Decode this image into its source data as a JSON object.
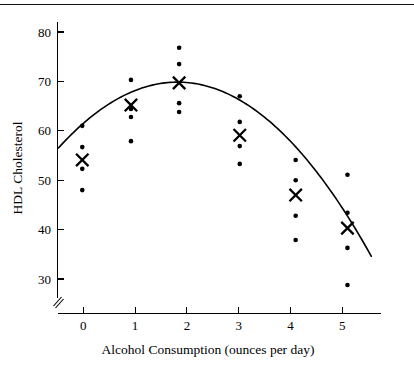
{
  "chart_data": {
    "type": "scatter",
    "title": "",
    "xlabel": "Alcohol Consumption (ounces per day)",
    "ylabel": "HDL Cholesterol",
    "xlim": [
      -0.62,
      5.75
    ],
    "ylim": [
      26.5,
      82.5
    ],
    "xticks": [
      0,
      1,
      2,
      3,
      4,
      5
    ],
    "xtick_labels": [
      "0",
      "1",
      "2",
      "3",
      "4",
      "5"
    ],
    "yticks": [
      30,
      40,
      50,
      60,
      70,
      80
    ],
    "ytick_labels": [
      "30",
      "40",
      "50",
      "60",
      "70",
      "80"
    ],
    "grid": false,
    "legend": "none",
    "axis_break": true,
    "point_color": "#000000",
    "curve_color": "#000000",
    "groups": [
      {
        "x": 0.0,
        "mean_x": -0.02,
        "mean_y": 54.1,
        "values": [
          61.0,
          56.7,
          52.3,
          48.0
        ]
      },
      {
        "x": 1.0,
        "mean_x": 0.92,
        "mean_y": 65.2,
        "values": [
          70.3,
          64.4,
          62.8,
          57.9
        ]
      },
      {
        "x": 2.0,
        "mean_x": 1.85,
        "mean_y": 69.7,
        "values": [
          76.8,
          73.5,
          65.6,
          63.8
        ]
      },
      {
        "x": 3.0,
        "mean_x": 3.02,
        "mean_y": 59.1,
        "values": [
          67.0,
          61.8,
          56.9,
          53.3
        ]
      },
      {
        "x": 4.0,
        "mean_x": 4.1,
        "mean_y": 47.0,
        "values": [
          54.1,
          50.0,
          42.8,
          37.9
        ]
      },
      {
        "x": 5.0,
        "mean_x": 5.1,
        "mean_y": 40.3,
        "values": [
          51.1,
          43.4,
          36.3,
          28.8
        ]
      }
    ],
    "fit_curve": {
      "kind": "quadratic",
      "x_start": -0.48,
      "x_end": 5.56,
      "vertex_x": 1.82,
      "vertex_y": 69.85,
      "a": -2.52
    }
  },
  "figure": {
    "top_rule": true
  }
}
